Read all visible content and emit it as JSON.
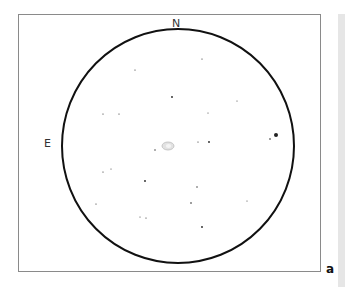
{
  "labels": {
    "north": "N",
    "east": "E",
    "panel": "a"
  },
  "field": {
    "center": [
      178,
      146
    ],
    "radius_x": 116,
    "radius_y": 117,
    "circle_color": "#111111",
    "frame_color": "#8a8a8a",
    "sidebar_color": "#e6e6e6"
  },
  "nebula": {
    "x": 168,
    "y": 146,
    "rx": 6,
    "ry": 4
  },
  "stars": [
    {
      "x": 202,
      "y": 59,
      "r": 0.6
    },
    {
      "x": 135,
      "y": 70,
      "r": 0.6
    },
    {
      "x": 172,
      "y": 97,
      "r": 0.9
    },
    {
      "x": 237,
      "y": 101,
      "r": 0.5
    },
    {
      "x": 103,
      "y": 114,
      "r": 0.6
    },
    {
      "x": 119,
      "y": 114,
      "r": 0.6
    },
    {
      "x": 208,
      "y": 113,
      "r": 0.5
    },
    {
      "x": 270,
      "y": 139,
      "r": 0.8
    },
    {
      "x": 276,
      "y": 135,
      "r": 2.0
    },
    {
      "x": 198,
      "y": 142,
      "r": 0.6
    },
    {
      "x": 209,
      "y": 142,
      "r": 0.9
    },
    {
      "x": 155,
      "y": 150,
      "r": 0.7
    },
    {
      "x": 103,
      "y": 172,
      "r": 0.6
    },
    {
      "x": 111,
      "y": 169,
      "r": 0.5
    },
    {
      "x": 145,
      "y": 181,
      "r": 0.9
    },
    {
      "x": 197,
      "y": 187,
      "r": 0.7
    },
    {
      "x": 96,
      "y": 204,
      "r": 0.6
    },
    {
      "x": 191,
      "y": 203,
      "r": 0.8
    },
    {
      "x": 247,
      "y": 201,
      "r": 0.5
    },
    {
      "x": 140,
      "y": 217,
      "r": 0.5
    },
    {
      "x": 146,
      "y": 218,
      "r": 0.6
    },
    {
      "x": 202,
      "y": 227,
      "r": 0.9
    }
  ]
}
